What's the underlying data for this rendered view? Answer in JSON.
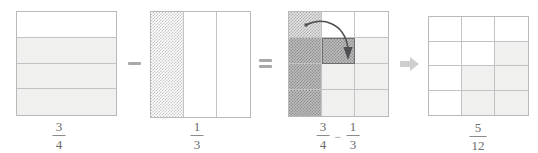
{
  "diagram": {
    "colors": {
      "outline": "#b9b9bb",
      "gridline": "#c3c3c5",
      "shade_light": "#f0f0ef",
      "hatch_light": "#c6c6c8",
      "hatch_medium": "#b0b0b2",
      "hatch_dark": "#8e8e90",
      "operator": "#a9a9ab",
      "text": "#6b6b6d",
      "arrow": "#4f4f51"
    },
    "figures": [
      {
        "id": "minuend",
        "name": "three-fourths-square",
        "rows": 4,
        "cols": 1,
        "shaded_count": 3,
        "total_count": 4,
        "label": {
          "numerator": "3",
          "denominator": "4"
        }
      },
      {
        "id": "subtrahend",
        "name": "one-third-square",
        "rows": 1,
        "cols": 3,
        "shaded_count": 1,
        "total_count": 3,
        "label": {
          "numerator": "1",
          "denominator": "3"
        }
      },
      {
        "id": "combined",
        "name": "twelfths-overlay-square",
        "rows": 4,
        "cols": 3,
        "total_count": 12,
        "label_left": {
          "numerator": "3",
          "denominator": "4"
        },
        "label_operator": "−",
        "label_right": {
          "numerator": "1",
          "denominator": "3"
        }
      },
      {
        "id": "result",
        "name": "five-twelfths-square",
        "rows": 4,
        "cols": 3,
        "shaded_count": 5,
        "total_count": 12,
        "label": {
          "numerator": "5",
          "denominator": "12"
        }
      }
    ],
    "operators": [
      {
        "name": "minus-operator",
        "symbol": "−"
      },
      {
        "name": "equals-operator",
        "symbol": "="
      },
      {
        "name": "result-arrow",
        "symbol": "→"
      }
    ],
    "annotations": [
      {
        "name": "move-cell-arrow",
        "description": "curved arrow moving top-left cell down into row two column two"
      }
    ]
  }
}
